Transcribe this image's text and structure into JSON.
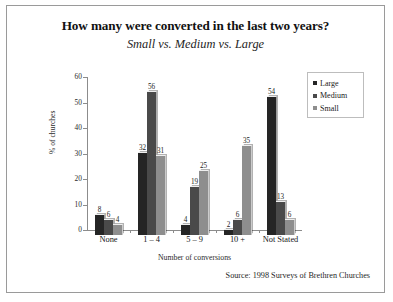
{
  "figure": {
    "title": "How many were converted in the last two years?",
    "subtitle": "Small vs. Medium vs. Large",
    "source": "Source: 1998 Surveys of Brethren Churches"
  },
  "chart_data": {
    "type": "bar",
    "title": "How many were converted in the last two years?",
    "subtitle": "Small vs. Medium vs. Large",
    "xlabel": "Number of conversions",
    "ylabel": "% of churches",
    "ylim": [
      0,
      60
    ],
    "yticks": [
      0,
      10,
      20,
      30,
      40,
      50,
      60
    ],
    "grid": false,
    "legend_position": "top-right",
    "categories": [
      "None",
      "1 – 4",
      "5 – 9",
      "10 +",
      "Not Stated"
    ],
    "series": [
      {
        "name": "Large",
        "color": "#252525",
        "values": [
          8,
          32,
          4,
          2,
          54
        ]
      },
      {
        "name": "Medium",
        "color": "#4a4a4a",
        "values": [
          6,
          56,
          19,
          6,
          13
        ]
      },
      {
        "name": "Small",
        "color": "#8e8e8e",
        "values": [
          4,
          31,
          25,
          35,
          6
        ]
      }
    ],
    "annotations": [
      "Source: 1998 Surveys of Brethren Churches"
    ]
  }
}
